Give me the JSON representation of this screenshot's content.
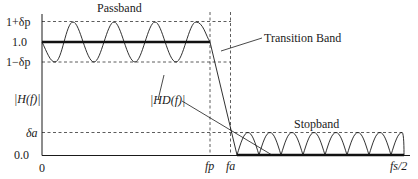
{
  "diagram": {
    "y_axis": {
      "label": "|H(f)|",
      "ticks": [
        {
          "label": "1+δp",
          "value": "1+delta_p"
        },
        {
          "label": "1.0",
          "value": 1.0
        },
        {
          "label": "1−δp",
          "value": "1-delta_p"
        },
        {
          "label": "δa",
          "value": "delta_a"
        },
        {
          "label": "0.0",
          "value": 0.0
        }
      ]
    },
    "x_axis": {
      "ticks": [
        {
          "label": "0"
        },
        {
          "label": "fp"
        },
        {
          "label": "fa"
        },
        {
          "label": "fs/2"
        }
      ]
    },
    "annotations": {
      "passband": "Passband",
      "transition": "Transition Band",
      "stopband": "Stopband",
      "desired": "|HD(f)|"
    },
    "colors": {
      "line": "#1a1a1a",
      "dashed": "#333333"
    }
  }
}
